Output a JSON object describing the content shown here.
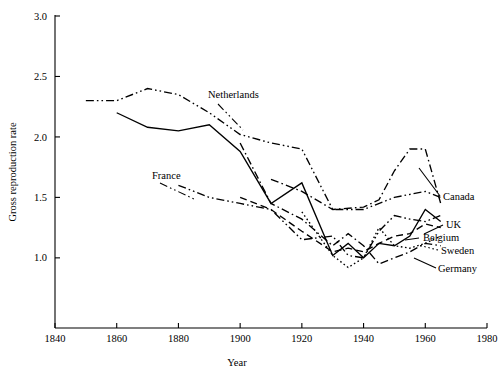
{
  "chart_data": {
    "type": "line",
    "title": "",
    "xlabel": "Year",
    "ylabel": "Gross reproduction rate",
    "xlim": [
      1840,
      1980
    ],
    "ylim": [
      0.42,
      3.0
    ],
    "grid": false,
    "legend_position": "inline-annotations",
    "xticks": [
      1840,
      1860,
      1880,
      1900,
      1920,
      1940,
      1960,
      1980
    ],
    "xtick_labels": [
      "1840",
      "1860",
      "1880",
      "1900",
      "1920",
      "1940",
      "1960",
      "1980"
    ],
    "yticks": [
      1.0,
      1.5,
      2.0,
      2.5,
      3.0
    ],
    "ytick_labels": [
      "1.0",
      "1.5",
      "2.0",
      "2.5",
      "3.0"
    ],
    "series": [
      {
        "name": "Netherlands",
        "label": "Netherlands",
        "dash": "dashdotdot",
        "x": [
          1850,
          1860,
          1870,
          1880,
          1890,
          1900,
          1910,
          1920,
          1930,
          1940,
          1950,
          1960,
          1965
        ],
        "y": [
          2.3,
          2.3,
          2.4,
          2.35,
          2.2,
          2.02,
          1.95,
          1.9,
          1.4,
          1.4,
          1.5,
          1.55,
          1.5
        ]
      },
      {
        "name": "Canada",
        "label": "Canada",
        "dash": "dashdot",
        "x": [
          1910,
          1920,
          1930,
          1940,
          1945,
          1950,
          1955,
          1960,
          1965
        ],
        "y": [
          1.65,
          1.55,
          1.4,
          1.42,
          1.48,
          1.72,
          1.9,
          1.9,
          1.45
        ]
      },
      {
        "name": "France",
        "label": "France",
        "dash": "dashdotdot",
        "x": [
          1880,
          1890,
          1900,
          1910,
          1920,
          1930,
          1935,
          1940,
          1945,
          1950,
          1955,
          1960,
          1965
        ],
        "y": [
          1.6,
          1.5,
          1.45,
          1.4,
          1.15,
          1.18,
          1.02,
          1.0,
          1.22,
          1.35,
          1.32,
          1.3,
          1.35
        ]
      },
      {
        "name": "UK",
        "label": "UK",
        "dash": "solid",
        "x": [
          1860,
          1870,
          1880,
          1890,
          1900,
          1910,
          1920,
          1930,
          1935,
          1940,
          1945,
          1950,
          1955,
          1960,
          1965
        ],
        "y": [
          2.2,
          2.08,
          2.05,
          2.1,
          1.88,
          1.45,
          1.62,
          1.02,
          1.12,
          1.0,
          1.12,
          1.1,
          1.18,
          1.4,
          1.3
        ]
      },
      {
        "name": "Belgium",
        "label": "Belgium",
        "dash": "dashed",
        "x": [
          1900,
          1910,
          1920,
          1930,
          1935,
          1940,
          1945,
          1950,
          1955,
          1960,
          1965
        ],
        "y": [
          1.5,
          1.4,
          1.22,
          1.05,
          1.08,
          1.05,
          1.12,
          1.18,
          1.2,
          1.28,
          1.25
        ]
      },
      {
        "name": "Sweden",
        "label": "Sweden",
        "dash": "dotted",
        "x": [
          1920,
          1930,
          1935,
          1940,
          1945,
          1950,
          1955,
          1960,
          1965
        ],
        "y": [
          1.38,
          1.02,
          0.92,
          1.0,
          1.25,
          1.1,
          1.08,
          1.12,
          1.18
        ]
      },
      {
        "name": "Germany",
        "label": "Germany",
        "dash": "dashdot",
        "x": [
          1900,
          1910,
          1920,
          1930,
          1935,
          1940,
          1945,
          1950,
          1955,
          1960,
          1965
        ],
        "y": [
          1.95,
          1.45,
          1.32,
          1.1,
          1.2,
          1.1,
          0.95,
          1.0,
          1.05,
          1.12,
          1.1
        ]
      }
    ],
    "annotations": [
      {
        "text": "Netherlands",
        "x_px": 208,
        "y_px": 98
      },
      {
        "text": "France",
        "x_px": 152,
        "y_px": 179
      },
      {
        "text": "Canada",
        "x_px": 443,
        "y_px": 200
      },
      {
        "text": "UK",
        "x_px": 446,
        "y_px": 228
      },
      {
        "text": "Belgium",
        "x_px": 423,
        "y_px": 241
      },
      {
        "text": "Sweden",
        "x_px": 441,
        "y_px": 254
      },
      {
        "text": "Germany",
        "x_px": 438,
        "y_px": 272
      }
    ]
  }
}
